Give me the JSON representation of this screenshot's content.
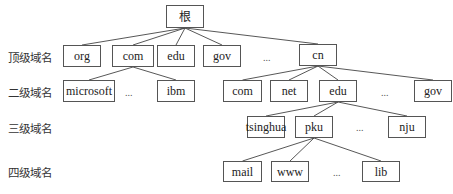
{
  "levels": [
    {
      "label": "顶级域名",
      "x": 8,
      "y": 49
    },
    {
      "label": "二级域名",
      "x": 8,
      "y": 84
    },
    {
      "label": "三级域名",
      "x": 8,
      "y": 120
    },
    {
      "label": "四级域名",
      "x": 8,
      "y": 164
    }
  ],
  "nodes": [
    {
      "id": "root",
      "label": "根",
      "x": 166,
      "y": 5,
      "w": 38,
      "h": 23
    },
    {
      "id": "org",
      "label": "org",
      "x": 63,
      "y": 45,
      "w": 38,
      "h": 22
    },
    {
      "id": "com",
      "label": "com",
      "x": 112,
      "y": 45,
      "w": 42,
      "h": 22
    },
    {
      "id": "edu",
      "label": "edu",
      "x": 157,
      "y": 45,
      "w": 38,
      "h": 22
    },
    {
      "id": "gov",
      "label": "gov",
      "x": 203,
      "y": 45,
      "w": 38,
      "h": 22
    },
    {
      "id": "cn",
      "label": "cn",
      "x": 299,
      "y": 44,
      "w": 38,
      "h": 22
    },
    {
      "id": "microsoft",
      "label": "microsoft",
      "x": 63,
      "y": 80,
      "w": 52,
      "h": 22
    },
    {
      "id": "ibm",
      "label": "ibm",
      "x": 157,
      "y": 80,
      "w": 38,
      "h": 22
    },
    {
      "id": "cn_com",
      "label": "com",
      "x": 223,
      "y": 80,
      "w": 39,
      "h": 22
    },
    {
      "id": "cn_net",
      "label": "net",
      "x": 270,
      "y": 80,
      "w": 38,
      "h": 22
    },
    {
      "id": "cn_edu",
      "label": "edu",
      "x": 319,
      "y": 80,
      "w": 38,
      "h": 22
    },
    {
      "id": "cn_gov",
      "label": "gov",
      "x": 414,
      "y": 80,
      "w": 38,
      "h": 22
    },
    {
      "id": "tsinghua",
      "label": "tsinghua",
      "x": 247,
      "y": 116,
      "w": 38,
      "h": 22
    },
    {
      "id": "pku",
      "label": "pku",
      "x": 295,
      "y": 116,
      "w": 38,
      "h": 22
    },
    {
      "id": "nju",
      "label": "nju",
      "x": 388,
      "y": 116,
      "w": 38,
      "h": 22
    },
    {
      "id": "mail",
      "label": "mail",
      "x": 223,
      "y": 161,
      "w": 39,
      "h": 21
    },
    {
      "id": "www",
      "label": "www",
      "x": 271,
      "y": 161,
      "w": 38,
      "h": 21
    },
    {
      "id": "lib",
      "label": "lib",
      "x": 362,
      "y": 161,
      "w": 38,
      "h": 21
    }
  ],
  "ellipses": [
    {
      "text": "...",
      "x": 263,
      "y": 52
    },
    {
      "text": "...",
      "x": 125,
      "y": 87
    },
    {
      "text": "...",
      "x": 381,
      "y": 87
    },
    {
      "text": "...",
      "x": 356,
      "y": 122
    },
    {
      "text": "...",
      "x": 333,
      "y": 167
    }
  ],
  "edges": [
    [
      "root",
      "org"
    ],
    [
      "root",
      "com"
    ],
    [
      "root",
      "edu"
    ],
    [
      "root",
      "gov"
    ],
    [
      "root",
      "cn"
    ],
    [
      "com",
      "microsoft"
    ],
    [
      "com",
      "ibm"
    ],
    [
      "cn",
      "cn_com"
    ],
    [
      "cn",
      "cn_net"
    ],
    [
      "cn",
      "cn_edu"
    ],
    [
      "cn",
      "cn_gov"
    ],
    [
      "cn_edu",
      "tsinghua"
    ],
    [
      "cn_edu",
      "pku"
    ],
    [
      "cn_edu",
      "nju"
    ],
    [
      "pku",
      "mail"
    ],
    [
      "pku",
      "www"
    ],
    [
      "pku",
      "lib"
    ]
  ]
}
